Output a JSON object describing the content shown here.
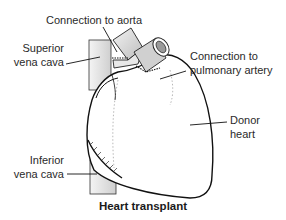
{
  "diagram": {
    "title": "Heart transplant",
    "labels": {
      "aorta": "Connection to aorta",
      "svc_line1": "Superior",
      "svc_line2": "vena cava",
      "pa_line1": "Connection to",
      "pa_line2": "pulmonary artery",
      "donor_line1": "Donor",
      "donor_line2": "heart",
      "ivc_line1": "Inferior",
      "ivc_line2": "vena cava"
    },
    "colors": {
      "outline": "#1a1a1a",
      "shade": "#d9d9d9",
      "background": "#ffffff"
    }
  }
}
